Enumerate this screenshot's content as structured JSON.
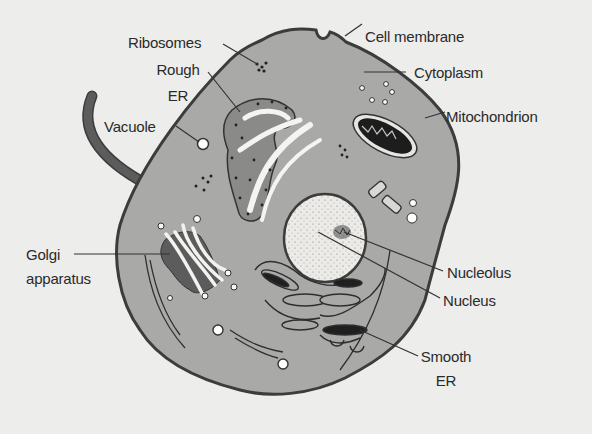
{
  "diagram": {
    "colors": {
      "background": "#ededeb",
      "cytoplasm": "#a9a9a7",
      "outline": "#3c3c3c",
      "organelle_dark": "#5f5f5f",
      "nucleus_fill": "#e9e9e6",
      "text": "#2a2a2a"
    },
    "labels": {
      "ribosomes": "Ribosomes",
      "rough_er_line1": "Rough",
      "rough_er_line2": "ER",
      "vacuole": "Vacuole",
      "golgi_line1": "Golgi",
      "golgi_line2": "apparatus",
      "cell_membrane": "Cell membrane",
      "cytoplasm": "Cytoplasm",
      "mitochondrion": "Mitochondrion",
      "nucleolus": "Nucleolus",
      "nucleus": "Nucleus",
      "smooth_er_line1": "Smooth",
      "smooth_er_line2": "ER"
    }
  }
}
